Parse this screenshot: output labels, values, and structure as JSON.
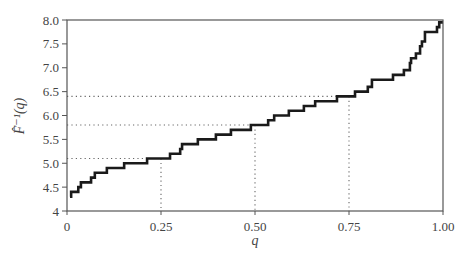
{
  "chart_data": {
    "type": "line",
    "subtype": "step",
    "title": "",
    "xlabel": "q",
    "ylabel": "F̂⁻¹(q)",
    "xlim": [
      0,
      1
    ],
    "ylim": [
      4,
      8
    ],
    "x_ticks": [
      0,
      0.25,
      0.5,
      0.75,
      1.0
    ],
    "x_tick_labels": [
      "0",
      "0.25",
      "0.50",
      "0.75",
      "1.00"
    ],
    "y_ticks": [
      4,
      4.5,
      5,
      5.5,
      6,
      6.5,
      7,
      7.5,
      8
    ],
    "y_tick_labels": [
      "4",
      "4.5",
      "5.0",
      "5.5",
      "6.0",
      "6.5",
      "7.0",
      "7.5",
      "8.0"
    ],
    "grid": false,
    "legend": null,
    "series": [
      {
        "name": "empirical quantile function",
        "steps": [
          {
            "q": 0.008,
            "value": 4.3
          },
          {
            "q": 0.011,
            "value": 4.4
          },
          {
            "q": 0.03,
            "value": 4.5
          },
          {
            "q": 0.037,
            "value": 4.6
          },
          {
            "q": 0.064,
            "value": 4.7
          },
          {
            "q": 0.074,
            "value": 4.8
          },
          {
            "q": 0.106,
            "value": 4.9
          },
          {
            "q": 0.152,
            "value": 5.0
          },
          {
            "q": 0.213,
            "value": 5.1
          },
          {
            "q": 0.274,
            "value": 5.2
          },
          {
            "q": 0.301,
            "value": 5.3
          },
          {
            "q": 0.306,
            "value": 5.4
          },
          {
            "q": 0.348,
            "value": 5.5
          },
          {
            "q": 0.396,
            "value": 5.6
          },
          {
            "q": 0.436,
            "value": 5.7
          },
          {
            "q": 0.489,
            "value": 5.8
          },
          {
            "q": 0.535,
            "value": 5.9
          },
          {
            "q": 0.551,
            "value": 6.0
          },
          {
            "q": 0.59,
            "value": 6.1
          },
          {
            "q": 0.63,
            "value": 6.2
          },
          {
            "q": 0.66,
            "value": 6.3
          },
          {
            "q": 0.718,
            "value": 6.4
          },
          {
            "q": 0.766,
            "value": 6.5
          },
          {
            "q": 0.8,
            "value": 6.6
          },
          {
            "q": 0.811,
            "value": 6.75
          },
          {
            "q": 0.867,
            "value": 6.85
          },
          {
            "q": 0.896,
            "value": 6.95
          },
          {
            "q": 0.912,
            "value": 7.1
          },
          {
            "q": 0.915,
            "value": 7.2
          },
          {
            "q": 0.928,
            "value": 7.3
          },
          {
            "q": 0.939,
            "value": 7.45
          },
          {
            "q": 0.944,
            "value": 7.55
          },
          {
            "q": 0.952,
            "value": 7.75
          },
          {
            "q": 0.984,
            "value": 7.85
          },
          {
            "q": 0.99,
            "value": 7.95
          },
          {
            "q": 1.0,
            "value": 7.95
          }
        ]
      }
    ],
    "annotations": [
      {
        "type": "dotted-guide",
        "q": 0.25,
        "value": 5.1
      },
      {
        "type": "dotted-guide",
        "q": 0.5,
        "value": 5.8
      },
      {
        "type": "dotted-guide",
        "q": 0.75,
        "value": 6.4
      }
    ],
    "colors": {
      "line": "#1a1a1a",
      "axis": "#444444",
      "guide": "#666666"
    }
  }
}
